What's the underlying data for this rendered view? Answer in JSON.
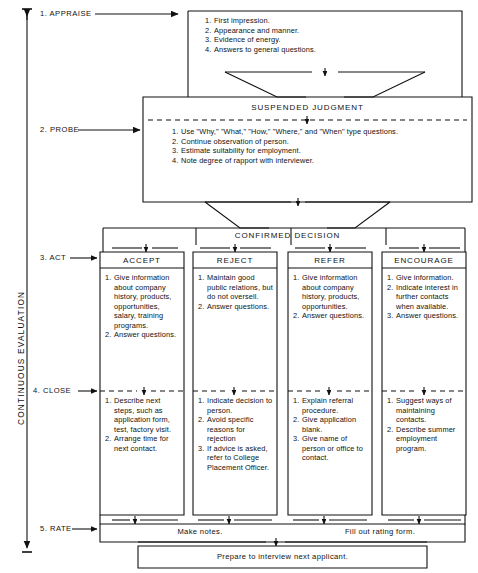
{
  "diagram": {
    "title_axis_label": "CONTINUOUS EVALUATION",
    "steps": [
      {
        "id": "appraise",
        "label": "1. APPRAISE"
      },
      {
        "id": "probe",
        "label": "2. PROBE"
      },
      {
        "id": "act",
        "label": "3. ACT"
      },
      {
        "id": "close",
        "label": "4. CLOSE"
      },
      {
        "id": "rate",
        "label": "5. RATE"
      }
    ],
    "appraise_box": {
      "items": [
        "First impression.",
        "Appearance and manner.",
        "Evidence of energy.",
        "Answers to general questions."
      ]
    },
    "suspended_judgment": {
      "heading": "SUSPENDED JUDGMENT",
      "items": [
        "Use \"Why,\" \"What,\" \"How,\" \"Where,\" and \"When\" type questions.",
        "Continue observation of person.",
        "Estimate suitability for employment.",
        "Note degree of rapport with interviewer."
      ]
    },
    "confirmed_decision": {
      "heading": "CONFIRMED DECISION"
    },
    "columns": [
      {
        "heading": "ACCEPT",
        "act_items": [
          "Give information about company history, products, opportunities, salary, training programs.",
          "Answer questions."
        ],
        "close_items": [
          "Describe next steps, such as application form, test, factory visit.",
          "Arrange time for next contact."
        ]
      },
      {
        "heading": "REJECT",
        "act_items": [
          "Maintain good public relations, but do not oversell.",
          "Answer questions."
        ],
        "close_items": [
          "Indicate decision to person.",
          "Avoid specific reasons for rejection",
          "If advice is asked, refer to College Placement Officer."
        ]
      },
      {
        "heading": "REFER",
        "act_items": [
          "Give information about company history, products, opportunities.",
          "Answer questions."
        ],
        "close_items": [
          "Explain referral procedure.",
          "Give application blank.",
          "Give name of person or office to contact."
        ]
      },
      {
        "heading": "ENCOURAGE",
        "act_items": [
          "Give information.",
          "Indicate interest in further contacts when available.",
          "Answer questions."
        ],
        "close_items": [
          "Suggest ways of maintaining contacts.",
          "Describe summer employment program."
        ]
      }
    ],
    "rate_row": {
      "left_label": "Make notes.",
      "right_label": "Fill out rating form."
    },
    "final_row": {
      "label": "Prepare to interview next applicant."
    },
    "colors": {
      "ink": "#111111",
      "paper": "#ffffff"
    }
  }
}
